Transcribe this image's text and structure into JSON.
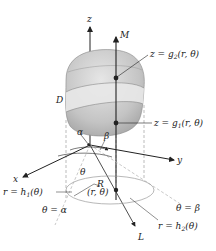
{
  "diagram": {
    "axes": {
      "x": "x",
      "y": "y",
      "z": "z"
    },
    "labels": {
      "M": "M",
      "L": "L",
      "D": "D",
      "R": "R",
      "point": "(r, θ)",
      "alpha": "α",
      "beta": "β",
      "theta": "θ",
      "upper_surface": "z = g",
      "upper_surface_sub": "2",
      "upper_surface_args": "(r, θ)",
      "lower_surface": "z = g",
      "lower_surface_sub": "1",
      "lower_surface_args": "(r, θ)",
      "inner_curve": "r = h",
      "inner_curve_sub": "1",
      "inner_curve_args": "(θ)",
      "outer_curve": "r = h",
      "outer_curve_sub": "2",
      "outer_curve_args": "(θ)",
      "ray_alpha": "θ = α",
      "ray_beta": "θ = β"
    },
    "colors": {
      "solid_fill": "#c8c8c8",
      "band_fill": "#e4e4e4",
      "line": "#222222",
      "dashed": "#aaaaaa"
    }
  }
}
